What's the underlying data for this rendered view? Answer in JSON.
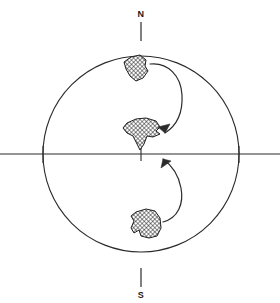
{
  "figure": {
    "name": "stereonet-pole-migration-diagram",
    "background_color": "#ffffff",
    "line_color": "#2b2b2b",
    "hatch_color": "#1f1f1f"
  },
  "primitive_circle": {
    "center_x": 141,
    "center_y": 154,
    "radius": 98,
    "stroke_width": 1.1
  },
  "labels": {
    "north": "N",
    "south": "S"
  },
  "axes": {
    "horizontal_line": {
      "x1": 0,
      "y1": 154,
      "x2": 280,
      "y2": 154
    },
    "ticks": [
      {
        "name": "north-tick",
        "x1": 141,
        "y1": 22,
        "x2": 141,
        "y2": 41
      },
      {
        "name": "south-tick",
        "x1": 141,
        "y1": 268,
        "x2": 141,
        "y2": 287
      },
      {
        "name": "center-tick",
        "x1": 141,
        "y1": 148,
        "x2": 141,
        "y2": 161
      },
      {
        "name": "west-tick",
        "x1": 43,
        "y1": 146,
        "x2": 43,
        "y2": 163
      },
      {
        "name": "east-tick",
        "x1": 239,
        "y1": 146,
        "x2": 239,
        "y2": 163
      }
    ]
  },
  "clusters": [
    {
      "name": "upper-cluster",
      "path": "M131,57 L140,55 L146,60 L145,66 L148,71 L143,78 L136,81 L130,76 L126,69 L124,62 Z"
    },
    {
      "name": "central-cluster",
      "path": "M127,123 L136,119 L146,118 L156,121 L160,127 L156,131 L160,134 L153,137 L147,136 L144,144 L140,150 L136,142 L133,136 L127,133 L123,128 Z"
    },
    {
      "name": "lower-cluster",
      "path": "M136,212 L146,209 L155,211 L160,218 L161,228 L157,236 L149,238 L141,236 L139,230 L134,233 L131,228 L134,221 L131,216 Z"
    }
  ],
  "arrows": [
    {
      "name": "upper-migration-arrow",
      "path": "M150,64 C168,62 181,76 182,95 C183,113 176,126 165,133",
      "head": "M165,133 L158,127 L170,124 Z"
    },
    {
      "name": "lower-migration-arrow",
      "path": "M163,222 C178,218 184,204 181,188 C178,172 170,164 163,159",
      "head": "M163,159 L161,168 L171,161 Z"
    }
  ]
}
